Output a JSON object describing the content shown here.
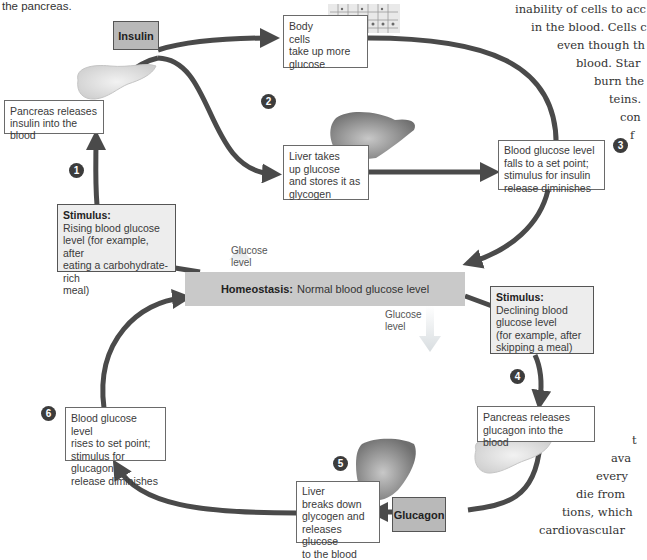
{
  "caption_fragment": "the pancreas.",
  "hormones": {
    "insulin": "Insulin",
    "glucagon": "Glucagon"
  },
  "homeostasis": {
    "label": "Homeostasis:",
    "text": "Normal blood glucose level"
  },
  "glucose_label_up": [
    "Glucose",
    "level"
  ],
  "glucose_label_down": [
    "Glucose",
    "level"
  ],
  "boxes": {
    "pancreas_insulin": "Pancreas releases insulin into the blood",
    "body_cells": [
      "Body",
      "cells",
      "take up more",
      "glucose"
    ],
    "liver_takes": [
      "Liver takes",
      "up glucose",
      "and stores it as",
      "glycogen"
    ],
    "blood_falls": [
      "Blood glucose level",
      "falls to a set point;",
      "stimulus for insulin",
      "release diminishes"
    ],
    "stimulus_rising": {
      "title": "Stimulus:",
      "lines": [
        "Rising blood glucose",
        "level (for example, after",
        "eating a carbohydrate-rich",
        "meal)"
      ]
    },
    "stimulus_declining": {
      "title": "Stimulus:",
      "lines": [
        "Declining blood",
        "glucose level",
        "(for example, after",
        "skipping a meal)"
      ]
    },
    "pancreas_glucagon": [
      "Pancreas releases",
      "glucagon into the blood"
    ],
    "liver_breaks": [
      "Liver",
      "breaks down",
      "glycogen and",
      "releases glucose",
      "to the blood"
    ],
    "blood_rises": [
      "Blood glucose level",
      "rises to set point;",
      "stimulus for glucagon",
      "release diminishes"
    ]
  },
  "badges": [
    "1",
    "2",
    "3",
    "4",
    "5",
    "6"
  ],
  "background_text_top": [
    "inability of cells to acc",
    "in the blood. Cells c",
    "even though th",
    "blood. Star",
    "burn the",
    "teins.",
    "con",
    "f"
  ],
  "background_text_bottom": [
    "t",
    "ava",
    "every",
    "die from",
    "tions, which",
    "cardiovascular"
  ],
  "colors": {
    "arrow": "#4a4a4a",
    "hormone_box": "#b9b9b9",
    "homeostasis_bar": "#c9c9c9",
    "badge": "#3c3c3c",
    "organ": "#8a8a8a"
  }
}
